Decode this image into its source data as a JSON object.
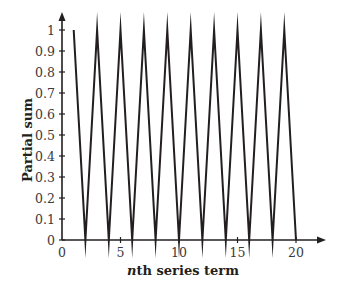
{
  "chart_data": {
    "type": "line",
    "title": "",
    "xlabel": "nth series term",
    "xlabel_italic_prefix": "n",
    "xlabel_rest": "th series term",
    "ylabel": "Partial sum",
    "x": [
      1,
      2,
      3,
      4,
      5,
      6,
      7,
      8,
      9,
      10,
      11,
      12,
      13,
      14,
      15,
      16,
      17,
      18,
      19,
      20
    ],
    "series": [
      {
        "name": "Partial sum",
        "values": [
          1,
          0,
          1,
          0,
          1,
          0,
          1,
          0,
          1,
          0,
          1,
          0,
          1,
          0,
          1,
          0,
          1,
          0,
          1,
          0
        ]
      }
    ],
    "xlim": [
      0,
      22
    ],
    "ylim": [
      0,
      1
    ],
    "xticks": [
      0,
      5,
      10,
      15,
      20
    ],
    "xtick_labels": [
      "0",
      "5",
      "10",
      "15",
      "20"
    ],
    "yticks": [
      0,
      0.1,
      0.2,
      0.3,
      0.4,
      0.5,
      0.6,
      0.7,
      0.8,
      0.9,
      1
    ],
    "ytick_labels": [
      "0",
      "0.1",
      "0.2",
      "0.3",
      "0.4",
      "0.5",
      "0.6",
      "0.7",
      "0.8",
      "0.9",
      "1"
    ],
    "grid": false,
    "legend": false,
    "line_color": "#231f20"
  }
}
